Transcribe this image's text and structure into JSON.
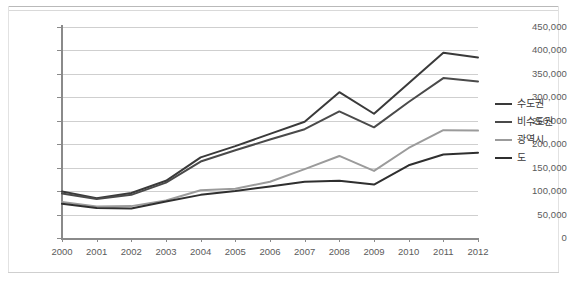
{
  "chart_data": {
    "type": "line",
    "title": "",
    "xlabel": "",
    "ylabel": "",
    "x": [
      "2000",
      "2001",
      "2002",
      "2003",
      "2004",
      "2005",
      "2006",
      "2007",
      "2008",
      "2009",
      "2010",
      "2011",
      "2012"
    ],
    "ylim": [
      0,
      450000
    ],
    "ytick_values": [
      0,
      50000,
      100000,
      150000,
      200000,
      250000,
      300000,
      350000,
      400000,
      450000
    ],
    "ytick_labels": [
      "0",
      "50,000",
      "100,000",
      "150,000",
      "200,000",
      "250,000",
      "300,000",
      "350,000",
      "400,000",
      "450,000"
    ],
    "grid": true,
    "legend_position": "right",
    "series": [
      {
        "name": "수도권",
        "color": "#3a3a3a",
        "values": [
          99000,
          85000,
          96000,
          122000,
          172000,
          196000,
          222000,
          248000,
          311000,
          265000,
          330000,
          395000,
          385000
        ]
      },
      {
        "name": "비수도권",
        "color": "#4a4a4a",
        "values": [
          95000,
          83000,
          92000,
          118000,
          163000,
          187000,
          210000,
          232000,
          270000,
          236000,
          290000,
          341000,
          334000
        ]
      },
      {
        "name": "광역시",
        "color": "#9b9b9b",
        "values": [
          77000,
          67000,
          68000,
          80000,
          102000,
          105000,
          120000,
          147000,
          175000,
          143000,
          192000,
          230000,
          229000
        ]
      },
      {
        "name": "도",
        "color": "#2f2f2f",
        "values": [
          73000,
          64000,
          63000,
          78000,
          92000,
          100000,
          110000,
          120000,
          122000,
          114000,
          155000,
          178000,
          182000
        ]
      }
    ]
  },
  "legend": {
    "items": [
      {
        "label": "수도권",
        "color": "#3a3a3a"
      },
      {
        "label": "비수도권",
        "color": "#4a4a4a"
      },
      {
        "label": "광역시",
        "color": "#9b9b9b"
      },
      {
        "label": "도",
        "color": "#2f2f2f"
      }
    ]
  }
}
